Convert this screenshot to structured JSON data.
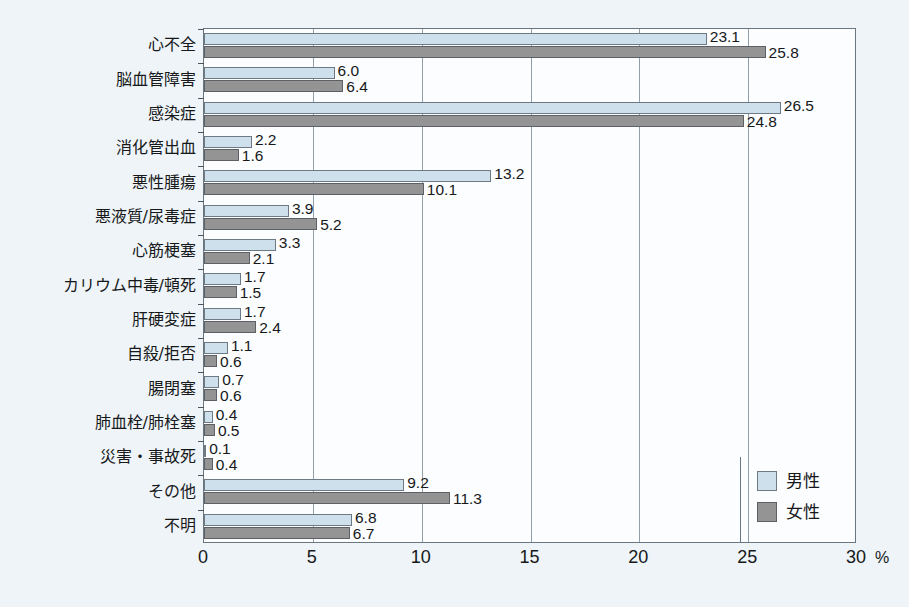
{
  "chart_data": {
    "type": "bar",
    "orientation": "horizontal",
    "title": "",
    "subtitle": "",
    "xlabel": "%",
    "ylabel": "",
    "xlim": [
      0,
      30
    ],
    "xticks": [
      "0",
      "5",
      "10",
      "15",
      "20",
      "25",
      "30"
    ],
    "grid": "vertical",
    "legend_position": "bottom-right",
    "categories": [
      "心不全",
      "脳血管障害",
      "感染症",
      "消化管出血",
      "悪性腫瘍",
      "悪液質/尿毒症",
      "心筋梗塞",
      "カリウム中毒/頓死",
      "肝硬変症",
      "自殺/拒否",
      "腸閉塞",
      "肺血栓/肺栓塞",
      "災害・事故死",
      "その他",
      "不明"
    ],
    "series": [
      {
        "name": "男性",
        "color": "#cde0ec",
        "values": [
          23.1,
          6.0,
          26.5,
          2.2,
          13.2,
          3.9,
          3.3,
          1.7,
          1.7,
          1.1,
          0.7,
          0.4,
          0.1,
          9.2,
          6.8
        ],
        "labels": [
          "23.1",
          "6.0",
          "26.5",
          "2.2",
          "13.2",
          "3.9",
          "3.3",
          "1.7",
          "1.7",
          "1.1",
          "0.7",
          "0.4",
          "0.1",
          "9.2",
          "6.8"
        ]
      },
      {
        "name": "女性",
        "color": "#949494",
        "values": [
          25.8,
          6.4,
          24.8,
          1.6,
          10.1,
          5.2,
          2.1,
          1.5,
          2.4,
          0.6,
          0.6,
          0.5,
          0.4,
          11.3,
          6.7
        ],
        "labels": [
          "25.8",
          "6.4",
          "24.8",
          "1.6",
          "10.1",
          "5.2",
          "2.1",
          "1.5",
          "2.4",
          "0.6",
          "0.6",
          "0.5",
          "0.4",
          "11.3",
          "6.7"
        ]
      }
    ]
  },
  "legend": {
    "items": [
      {
        "label": "男性",
        "swatch": "male"
      },
      {
        "label": "女性",
        "swatch": "female"
      }
    ]
  },
  "axis": {
    "unit_label": "%"
  }
}
